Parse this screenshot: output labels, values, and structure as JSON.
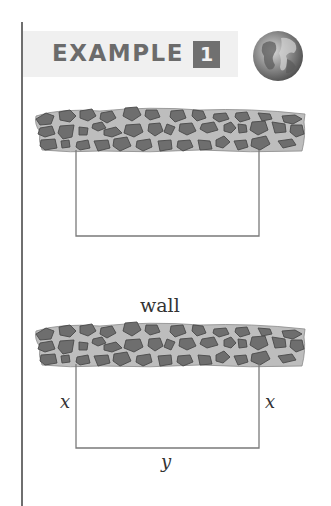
{
  "header": {
    "label": "EXAMPLE",
    "number": "1",
    "icon": "globe-icon"
  },
  "figure_top": {
    "elements": [
      "stone-wall",
      "rectangular-fence"
    ]
  },
  "figure_bottom": {
    "wall_label": "wall",
    "left_side_label": "x",
    "right_side_label": "x",
    "bottom_side_label": "y"
  },
  "colors": {
    "stone": "#6e6e6e",
    "stone_outline": "#4a4a4a",
    "mortar": "#bdbdbd",
    "fence": "#7a7a7a",
    "header_band": "#f0f0f0",
    "header_text": "#6b6b6b"
  }
}
